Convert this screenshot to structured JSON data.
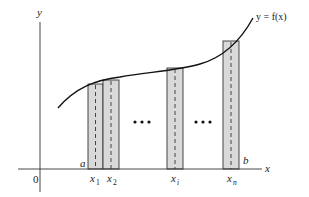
{
  "diagram": {
    "type": "riemann-sum-midpoint-rectangles",
    "axes": {
      "x_label": "x",
      "y_label": "y",
      "origin_label": "0"
    },
    "curve": {
      "label": "y = f(x)"
    },
    "interval": {
      "start_label": "a",
      "end_label": "b"
    },
    "sample_points": [
      {
        "base": "x",
        "sub": "1"
      },
      {
        "base": "x",
        "sub": "2"
      },
      {
        "base": "x",
        "sub": "i"
      },
      {
        "base": "x",
        "sub": "n"
      }
    ],
    "ellipsis": [
      "• • •",
      "• • •"
    ],
    "colors": {
      "rect_fill": "#d9d9d9",
      "rect_stroke": "#333333",
      "curve": "#111111",
      "axis": "#333333"
    }
  }
}
